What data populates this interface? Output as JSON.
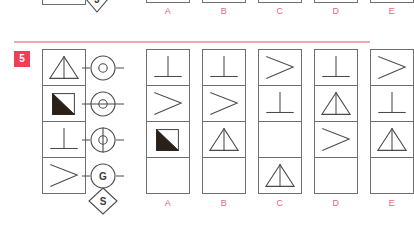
{
  "previous_question": {
    "symbol": {
      "shape": "diamond",
      "letter": "J"
    },
    "option_labels": [
      "A",
      "B",
      "C",
      "D",
      "E"
    ]
  },
  "divider_color": "#f3a7b4",
  "question": {
    "number": "5",
    "badge_color": "#ef3e56",
    "label_color": "#e8677d",
    "stem_column": {
      "name": "matrix-column",
      "cells": [
        {
          "figure": "triangle-with-vertical-line"
        },
        {
          "figure": "square-with-filled-lower-left-triangle"
        },
        {
          "figure": "perpendicular-tack"
        },
        {
          "figure": "greater-than-chevron"
        }
      ]
    },
    "symbol_column": {
      "name": "operator-column",
      "symbols": [
        {
          "shape": "circle",
          "inner": "small-circle",
          "line": "none",
          "letter": ""
        },
        {
          "shape": "circle",
          "inner": "small-circle",
          "line": "horizontal",
          "letter": ""
        },
        {
          "shape": "circle",
          "inner": "small-circle",
          "line": "vertical",
          "letter": ""
        },
        {
          "shape": "circle",
          "inner": "letter",
          "line": "none",
          "letter": "G"
        },
        {
          "shape": "diamond",
          "inner": "letter",
          "line": "none",
          "letter": "S"
        }
      ]
    },
    "options": [
      {
        "label": "A",
        "cells": [
          "perpendicular-tack",
          "greater-than-chevron",
          "square-with-filled-lower-left-triangle",
          "empty"
        ]
      },
      {
        "label": "B",
        "cells": [
          "perpendicular-tack",
          "greater-than-chevron",
          "triangle-with-vertical-line",
          "empty"
        ]
      },
      {
        "label": "C",
        "cells": [
          "greater-than-chevron",
          "perpendicular-tack",
          "empty",
          "triangle-with-vertical-line"
        ]
      },
      {
        "label": "D",
        "cells": [
          "perpendicular-tack",
          "triangle-with-vertical-line",
          "greater-than-chevron",
          "empty"
        ]
      },
      {
        "label": "E",
        "cells": [
          "greater-than-chevron",
          "perpendicular-tack",
          "triangle-with-vertical-line",
          "empty"
        ]
      }
    ]
  }
}
